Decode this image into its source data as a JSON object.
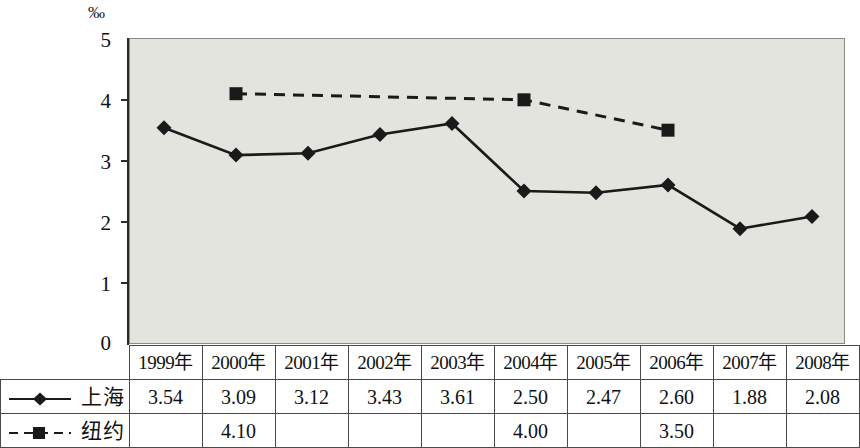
{
  "chart_data": {
    "type": "line",
    "title": "",
    "xlabel": "",
    "ylabel": "",
    "unit_label": "‰",
    "ylim": [
      0,
      5
    ],
    "ytick_labels": [
      "0",
      "1",
      "2",
      "3",
      "4",
      "5"
    ],
    "grid": false,
    "legend_position": "table-left-column",
    "categories": [
      "1999年",
      "2000年",
      "2001年",
      "2002年",
      "2003年",
      "2004年",
      "2005年",
      "2006年",
      "2007年",
      "2008年"
    ],
    "series": [
      {
        "name": "上海",
        "marker": "diamond",
        "line_style": "solid",
        "color": "#1a1a1a",
        "values": [
          3.54,
          3.09,
          3.12,
          3.43,
          3.61,
          2.5,
          2.47,
          2.6,
          1.88,
          2.08
        ],
        "labels": [
          "3.54",
          "3.09",
          "3.12",
          "3.43",
          "3.61",
          "2.50",
          "2.47",
          "2.60",
          "1.88",
          "2.08"
        ]
      },
      {
        "name": "纽约",
        "marker": "square",
        "line_style": "dashed",
        "color": "#1a1a1a",
        "values": [
          null,
          4.1,
          null,
          null,
          null,
          4.0,
          null,
          3.5,
          null,
          null
        ],
        "labels": [
          "",
          "4.10",
          "",
          "",
          "",
          "4.00",
          "",
          "3.50",
          "",
          ""
        ]
      }
    ]
  },
  "chart": {
    "unit": "‰",
    "plot_background": "#e4e4df",
    "axis_color": "#2b2b2b",
    "y_ticks": [
      "5",
      "4",
      "3",
      "2",
      "1",
      "0"
    ]
  },
  "table": {
    "header": [
      "",
      "1999年",
      "2000年",
      "2001年",
      "2002年",
      "2003年",
      "2004年",
      "2005年",
      "2006年",
      "2007年",
      "2008年"
    ],
    "rows": [
      {
        "label": "上海",
        "cells": [
          "3.54",
          "3.09",
          "3.12",
          "3.43",
          "3.61",
          "2.50",
          "2.47",
          "2.60",
          "1.88",
          "2.08"
        ]
      },
      {
        "label": "纽约",
        "cells": [
          "",
          "4.10",
          "",
          "",
          "",
          "4.00",
          "",
          "3.50",
          "",
          ""
        ]
      }
    ]
  }
}
